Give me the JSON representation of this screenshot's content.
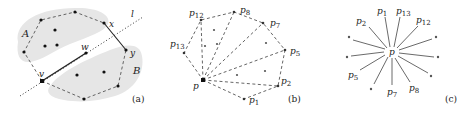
{
  "figure": {
    "panels": [
      {
        "id": "a",
        "caption": "(a)",
        "labels": {
          "A": "A",
          "B": "B",
          "x": "x",
          "y": "y",
          "w": "w",
          "v": "v",
          "l": "l"
        }
      },
      {
        "id": "b",
        "caption": "(b)",
        "labels": {
          "p": "p",
          "p1": "1",
          "p2": "2",
          "p5": "5",
          "p7": "7",
          "p8": "8",
          "p12": "12",
          "p13": "13",
          "pbase": "p"
        }
      },
      {
        "id": "c",
        "caption": "(c)",
        "labels": {
          "p": "p",
          "p1": "1",
          "p13": "13",
          "p2": "2",
          "p12": "12",
          "p5": "5",
          "p7": "7",
          "p8": "8",
          "pbase": "p"
        }
      }
    ],
    "colors": {
      "region_fill": "#e6e6e6",
      "ink": "#222222",
      "dash": "#555555"
    }
  }
}
